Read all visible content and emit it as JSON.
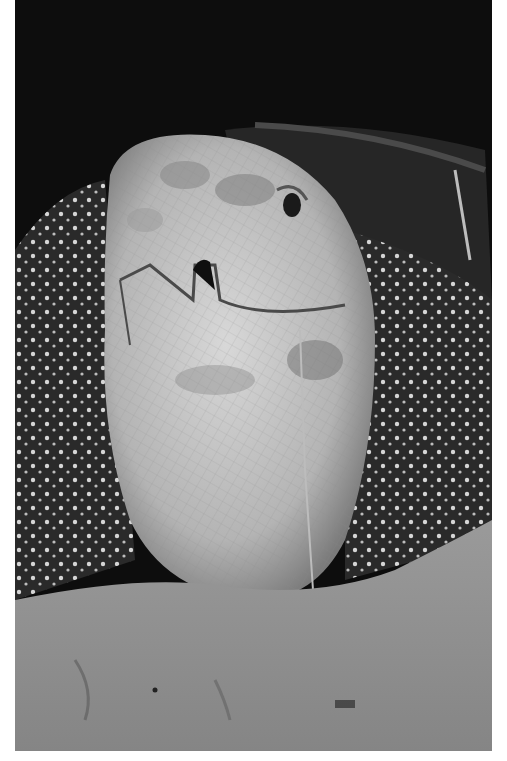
{
  "photo": {
    "subject": "leatherback sea turtle on sand",
    "frame": {
      "x": 15,
      "y": 0,
      "width": 477,
      "height": 751
    },
    "colors": {
      "background": "#0d0d0d",
      "border": "#ffffff",
      "sand": "#8e8e8e",
      "sand_dark": "#6b6b6b",
      "head_light": "#cfcfcf",
      "head_mid": "#a9a9a9",
      "shell_dark": "#2a2a2a",
      "spots": "#e0e0e0"
    }
  }
}
